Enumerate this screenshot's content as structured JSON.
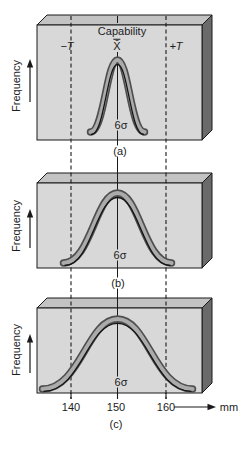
{
  "figure_title": "Process capability diagram",
  "labels": {
    "capability": "Capability",
    "mean": "X̄",
    "tol_minus": "−T",
    "tol_plus": "+T",
    "sigma_span": "6σ",
    "frequency": "Frequency",
    "unit": "mm"
  },
  "axis": {
    "ticks": [
      "140",
      "150",
      "160"
    ],
    "unit": "mm"
  },
  "panels": [
    {
      "caption": "(a)",
      "spread": "narrow — 6σ well within tolerance",
      "sigma_label": "6σ"
    },
    {
      "caption": "(b)",
      "spread": "medium — 6σ equals tolerance width",
      "sigma_label": "6σ"
    },
    {
      "caption": "(c)",
      "spread": "wide — 6σ exceeds tolerance",
      "sigma_label": "6σ"
    }
  ],
  "colors": {
    "slab_face": "#d8d8d8",
    "slab_top": "#c3c3c3",
    "slab_side": "#6a6a6a",
    "band_outer": "#4f4f4f",
    "band_inner": "#ababab",
    "line": "#1a1a1a"
  }
}
